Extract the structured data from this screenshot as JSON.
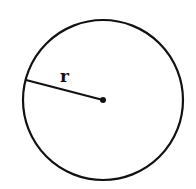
{
  "diagram": {
    "type": "circle-with-radius",
    "labels": {
      "radius": "r"
    },
    "colors": {
      "stroke": "#111111",
      "background": "#ffffff"
    },
    "geometry": {
      "center": [
        103,
        100
      ],
      "radius": 80,
      "radius_endpoint": [
        26,
        80
      ]
    }
  }
}
